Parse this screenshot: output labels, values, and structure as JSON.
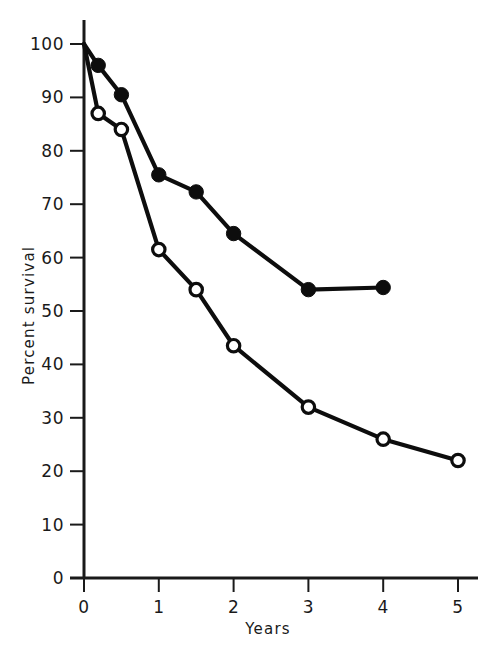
{
  "chart_data": {
    "type": "line",
    "title": "",
    "subtitle": "",
    "xlabel": "Years",
    "ylabel": "Percent survival",
    "xlim": [
      0,
      5.4
    ],
    "ylim": [
      0,
      104
    ],
    "grid": false,
    "legend": "none",
    "x_ticks": [
      "0",
      "1",
      "2",
      "3",
      "4",
      "5"
    ],
    "x_tick_values": [
      0,
      1,
      2,
      3,
      4,
      5
    ],
    "y_ticks": [
      "0",
      "10",
      "20",
      "30",
      "40",
      "50",
      "60",
      "70",
      "80",
      "90",
      "100"
    ],
    "y_tick_values": [
      0,
      10,
      20,
      30,
      40,
      50,
      60,
      70,
      80,
      90,
      100
    ],
    "series": [
      {
        "name": "Filled circles",
        "marker": "filled-circle",
        "color": "#0d0d0d",
        "x": [
          0,
          0.19,
          0.5,
          1.0,
          1.5,
          2.0,
          3.0,
          4.0
        ],
        "values": [
          100,
          96,
          90.5,
          75.5,
          72.3,
          64.5,
          54,
          54.4
        ]
      },
      {
        "name": "Open circles",
        "marker": "open-circle",
        "color": "#0d0d0d",
        "x": [
          0,
          0.19,
          0.5,
          1.0,
          1.5,
          2.0,
          3.0,
          4.0,
          5.0
        ],
        "values": [
          100,
          87,
          84,
          61.5,
          54,
          43.5,
          32,
          26,
          22
        ]
      }
    ]
  },
  "axis": {
    "x_title": "Years",
    "y_title": "Percent survival"
  }
}
